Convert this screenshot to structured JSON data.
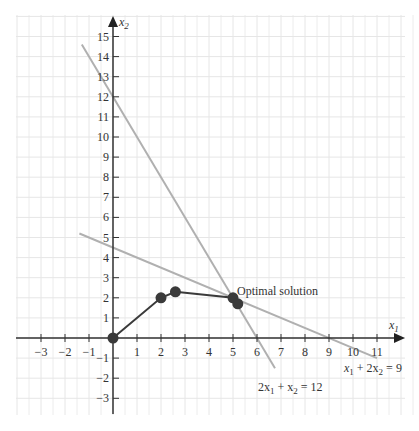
{
  "chart_data": {
    "type": "line",
    "title": "",
    "xlabel": "x1",
    "ylabel": "x2",
    "xlim": [
      -4,
      12
    ],
    "ylim": [
      -4,
      16
    ],
    "grid": true,
    "x_ticks": [
      -3,
      -2,
      -1,
      1,
      2,
      3,
      4,
      5,
      6,
      7,
      8,
      9,
      10,
      11
    ],
    "y_ticks": [
      -3,
      -2,
      -1,
      1,
      2,
      3,
      4,
      5,
      6,
      7,
      8,
      9,
      10,
      11,
      12,
      13,
      14,
      15
    ],
    "constraint_lines": [
      {
        "name": "2x1 + x2 = 12",
        "from": [
          -1.3,
          14.6
        ],
        "to": [
          6.75,
          -1.5
        ],
        "color": "#b0b0b0"
      },
      {
        "name": "x1 + 2x2 = 9",
        "from": [
          -1.4,
          5.2
        ],
        "to": [
          11,
          -1.0
        ],
        "color": "#b0b0b0"
      }
    ],
    "series": [
      {
        "name": "search path",
        "points": [
          [
            0,
            0
          ],
          [
            2,
            2
          ],
          [
            2.6,
            2.3
          ],
          [
            5,
            2
          ],
          [
            5.2,
            1.7
          ]
        ],
        "color": "#3a3a3a"
      }
    ],
    "annotations": [
      {
        "text": "Optimal solution",
        "at": [
          5.1,
          2.4
        ]
      },
      {
        "text": "2x1 + x2 = 12",
        "at": [
          4.9,
          -2.4
        ]
      },
      {
        "text": "x1 + 2x2 = 9",
        "at": [
          9.5,
          -0.3
        ]
      }
    ]
  },
  "labels": {
    "x_axis": "x",
    "x_axis_sub": "1",
    "y_axis": "x",
    "y_axis_sub": "2",
    "optimal": "Optimal solution",
    "eq1_a": "2x",
    "eq1_a_sub": "1",
    "eq1_b": " + x",
    "eq1_b_sub": "2",
    "eq1_c": " = 12",
    "eq2_a": "x",
    "eq2_a_sub": "1",
    "eq2_b": " + 2x",
    "eq2_b_sub": "2",
    "eq2_c": " = 9"
  }
}
